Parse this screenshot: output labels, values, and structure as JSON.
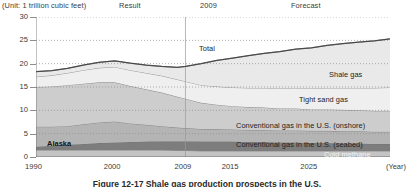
{
  "header": {
    "unit": "(Unit: 1 trillion cubic feet)",
    "result": "Result",
    "divider_year": "2009",
    "forecast": "Forecast"
  },
  "axis": {
    "x_unit": "(Year)",
    "y_ticks": [
      "30",
      "25",
      "20",
      "15",
      "10",
      "5",
      "0"
    ],
    "x_ticks": [
      "1990",
      "2000",
      "2009",
      "2015",
      "2025"
    ]
  },
  "labels": {
    "total": "Total",
    "shale": "Shale gas",
    "tight": "Tight sand gas",
    "onshore": "Conventional gas in the U.S. (onshore)",
    "seabed": "Conventional gas in the U.S. (seabed)",
    "coal": "Cold methane",
    "alaska": "Alaska"
  },
  "caption": "Figure 12-17  Shale gas production prospects in the U.S.",
  "colors": {
    "shale": "#e9e9e9",
    "tight": "#efefef",
    "onshore": "#cdcdcd",
    "seabed": "#b4b4b4",
    "coal": "#7d7d7d",
    "alaska": "#c4c4c4",
    "total_line": "#4a4a4a",
    "grid": "#8d8d8d",
    "axis": "#6a6a6a"
  },
  "chart_data": {
    "type": "area",
    "title": "Shale gas production prospects in the U.S.",
    "xlabel": "(Year)",
    "ylabel": "(Unit: 1 trillion cubic feet)",
    "xlim": [
      1990,
      2035
    ],
    "ylim": [
      0,
      30
    ],
    "grid": true,
    "legend": "inline-annotations",
    "divider_x": 2009,
    "divider_labels": [
      "Result",
      "Forecast"
    ],
    "x": [
      1990,
      1992,
      1994,
      1996,
      1998,
      2000,
      2002,
      2004,
      2006,
      2008,
      2009,
      2011,
      2013,
      2015,
      2017,
      2019,
      2021,
      2023,
      2025,
      2027,
      2029,
      2031,
      2033,
      2035
    ],
    "series": [
      {
        "name": "Alaska",
        "values": [
          1.5,
          1.5,
          1.5,
          1.5,
          1.5,
          1.5,
          1.5,
          1.5,
          1.5,
          1.4,
          1.4,
          1.3,
          1.3,
          1.3,
          1.3,
          1.3,
          1.3,
          1.3,
          1.3,
          1.3,
          1.3,
          1.3,
          1.3,
          1.3
        ]
      },
      {
        "name": "Cold methane",
        "values": [
          0.7,
          0.9,
          1.1,
          1.3,
          1.5,
          1.6,
          1.7,
          1.8,
          1.9,
          2.0,
          2.0,
          2.0,
          2.0,
          2.0,
          1.9,
          1.9,
          1.8,
          1.8,
          1.7,
          1.7,
          1.6,
          1.6,
          1.5,
          1.5
        ]
      },
      {
        "name": "Conventional gas in the U.S. (seabed)",
        "values": [
          4.3,
          4.1,
          4.0,
          4.2,
          4.4,
          4.5,
          4.0,
          3.6,
          3.2,
          2.9,
          2.8,
          2.7,
          2.7,
          2.6,
          2.6,
          2.6,
          2.6,
          2.6,
          2.6,
          2.6,
          2.6,
          2.6,
          2.6,
          2.6
        ]
      },
      {
        "name": "Conventional gas in the U.S. (onshore)",
        "values": [
          8.5,
          8.6,
          8.8,
          8.7,
          8.6,
          8.4,
          8.0,
          7.6,
          7.2,
          6.6,
          6.3,
          5.6,
          5.2,
          5.0,
          4.9,
          4.8,
          4.7,
          4.7,
          4.6,
          4.6,
          4.6,
          4.5,
          4.5,
          4.5
        ]
      },
      {
        "name": "Tight sand gas",
        "values": [
          2.2,
          2.4,
          2.6,
          2.9,
          3.1,
          3.3,
          3.4,
          3.5,
          3.6,
          3.7,
          3.7,
          3.8,
          3.9,
          4.0,
          4.1,
          4.2,
          4.3,
          4.4,
          4.5,
          4.6,
          4.7,
          4.8,
          4.9,
          5.0
        ]
      },
      {
        "name": "Shale gas",
        "values": [
          1.1,
          1.0,
          1.0,
          1.1,
          1.2,
          1.3,
          1.5,
          1.7,
          2.0,
          2.6,
          3.2,
          4.6,
          5.6,
          6.3,
          6.9,
          7.4,
          7.9,
          8.3,
          8.7,
          9.1,
          9.5,
          9.8,
          10.1,
          10.4
        ]
      }
    ],
    "total": {
      "name": "Total",
      "values": [
        18.3,
        18.5,
        19.0,
        19.7,
        20.3,
        20.6,
        20.1,
        19.7,
        19.4,
        19.2,
        19.4,
        20.0,
        20.7,
        21.2,
        21.7,
        22.2,
        22.6,
        23.1,
        23.4,
        23.9,
        24.3,
        24.6,
        24.9,
        25.3
      ]
    }
  }
}
